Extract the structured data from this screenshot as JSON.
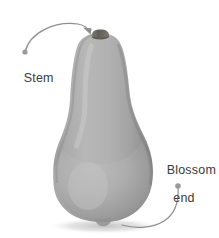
{
  "figure": {
    "background_color": "#ffffff",
    "width": 219,
    "height": 238
  },
  "subject": {
    "name": "butternut-squash",
    "body_color_light": "#b9b9b9",
    "body_color_mid": "#a3a3a3",
    "body_color_dark": "#8a8a8a",
    "body_edge_color": "#7d7d7d",
    "stem_color": "#6a6a63",
    "shadow_color": "#c9c9c9"
  },
  "annotations": [
    {
      "id": "stem",
      "label": "Stem",
      "label_lines": [
        "Stem"
      ],
      "text_color": "#3b3b3b",
      "leader_color": "#8f8f8f",
      "dot_color": "#9a9a9a",
      "dot": {
        "x": 25,
        "y": 52
      },
      "target": {
        "x": 93,
        "y": 36
      },
      "arrowhead": true
    },
    {
      "id": "blossom-end",
      "label": "Blossom end",
      "label_lines": [
        "Blossom",
        "end"
      ],
      "text_color": "#3b3b3b",
      "leader_color": "#8f8f8f",
      "dot_color": "#9a9a9a",
      "dot": {
        "x": 178,
        "y": 186
      },
      "target": {
        "x": 122,
        "y": 224
      },
      "arrowhead": false
    }
  ]
}
